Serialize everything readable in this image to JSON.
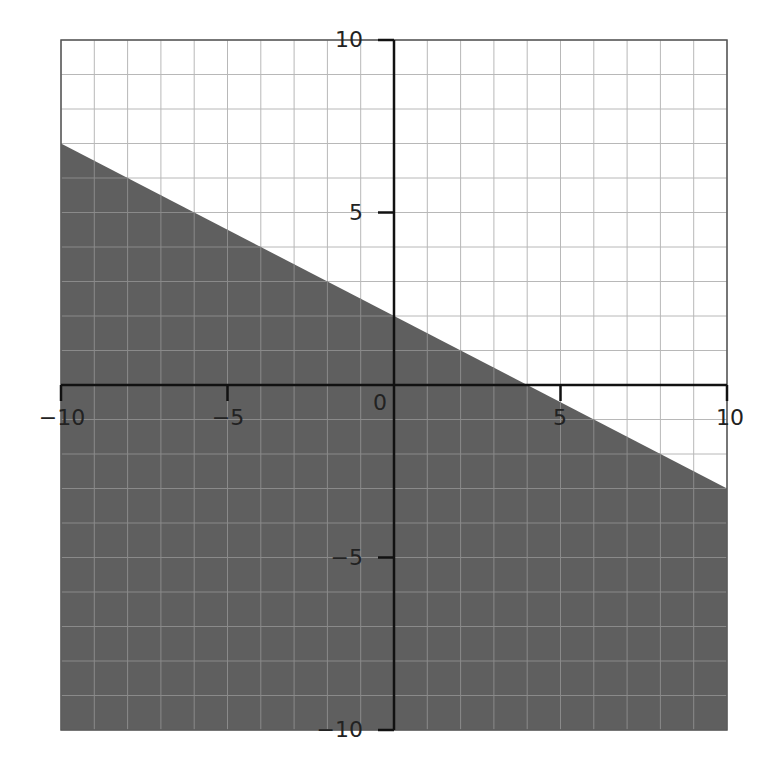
{
  "chart_data": {
    "type": "area",
    "title": "",
    "xlabel": "",
    "ylabel": "",
    "xlim": [
      -10,
      10
    ],
    "ylim": [
      -10,
      10
    ],
    "grid": true,
    "grid_step": 1,
    "x_ticks": [
      -10,
      -5,
      0,
      5,
      10
    ],
    "y_ticks": [
      -10,
      -5,
      5,
      10
    ],
    "x_tick_labels": [
      "−10",
      "−5",
      "0",
      "5",
      "10"
    ],
    "y_tick_labels": [
      "−10",
      "−5",
      "5",
      "10"
    ],
    "boundary_line": {
      "slope": -0.5,
      "intercept": 2,
      "style": "solid",
      "points": [
        [
          -10,
          7
        ],
        [
          10,
          -3
        ]
      ]
    },
    "shaded_region": "below",
    "colors": {
      "shade": "#5f5f5f",
      "grid_light": "#b8b8b8",
      "grid_on_shade": "#8a8a8a",
      "axis": "#111111",
      "background": "#ffffff"
    }
  },
  "labels": {
    "origin": "0",
    "x_neg10": "−10",
    "x_neg5": "−5",
    "x_5": "5",
    "x_10": "10",
    "y_10": "10",
    "y_5": "5",
    "y_neg5": "−5",
    "y_neg10": "−10"
  }
}
